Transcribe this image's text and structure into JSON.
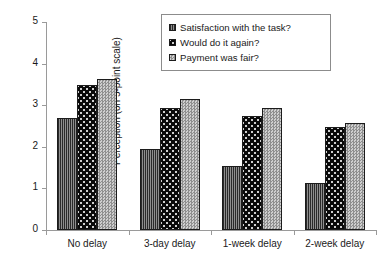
{
  "chart_data": {
    "type": "bar",
    "title": "",
    "xlabel": "",
    "ylabel": "Perception (on 5-point scale)",
    "categories": [
      "No delay",
      "3-day delay",
      "1-week delay",
      "2-week delay"
    ],
    "series": [
      {
        "name": "Satisfaction with the task?",
        "pattern": "vertical-hatch-dark-gray",
        "color": "#6e6e6e",
        "values": [
          2.69,
          1.95,
          1.54,
          1.12
        ]
      },
      {
        "name": "Would do it again?",
        "pattern": "black-with-dots",
        "color": "#0a0a0a",
        "values": [
          3.49,
          2.94,
          2.75,
          2.48
        ]
      },
      {
        "name": "Payment was fair?",
        "pattern": "light-gray-checker",
        "color": "#b4b4b4",
        "values": [
          3.62,
          3.15,
          2.93,
          2.58
        ]
      }
    ],
    "ylim": [
      0,
      5
    ],
    "yticks": [
      "0",
      "1",
      "2",
      "3",
      "4",
      "5"
    ],
    "grid": false,
    "legend_position": "top-center-inside",
    "legend_border_color": "#8c8c8c",
    "axis_color": "#9a9a9a",
    "bar_edge_color": "#1c1c1c",
    "background": "#ffffff"
  }
}
